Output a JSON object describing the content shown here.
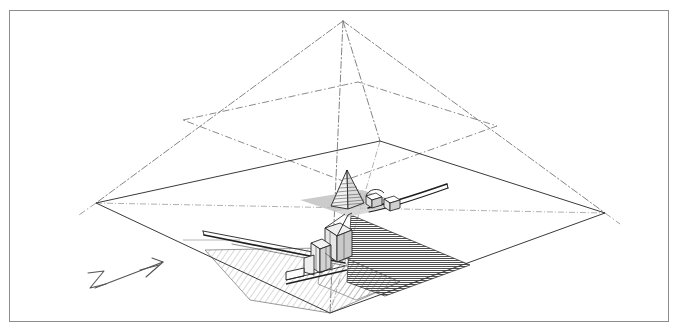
{
  "figure": {
    "kind": "axonometric-reconstruction-drawing",
    "subject": "Pyramid complex axonometric reconstruction",
    "caption": "",
    "background_color": "#ffffff",
    "frame": {
      "visible": true,
      "stroke_color": "#8c8c8c",
      "stroke_width": 1,
      "x": 9,
      "y": 10,
      "width": 659,
      "height": 311
    }
  },
  "palette": {
    "line_dark": "#2b2b2b",
    "line_mid": "#555555",
    "line_light": "#9a9a9a",
    "construction_line": "#767676",
    "hatch_light": "#8e8e8e",
    "hatch_dark": "#4f4f4f",
    "fill_dark_shade": "#6e6e6e",
    "shadow_gray": "#b9b9b9",
    "paper": "#ffffff"
  },
  "geometry": {
    "base_platform": {
      "name": "ground-base-quadrilateral",
      "description": "Large flat rhombus representing the pyramid base / ground plane in axonometric projection",
      "vertices": [
        {
          "label": "west",
          "x": 96,
          "y": 203
        },
        {
          "label": "north",
          "x": 380,
          "y": 141
        },
        {
          "label": "east",
          "x": 605,
          "y": 213
        },
        {
          "label": "south",
          "x": 330,
          "y": 313
        }
      ],
      "stroke_color": "#3a3a3a",
      "stroke_width": 1
    },
    "pyramid_reconstruction": {
      "name": "pyramid-edge-reconstruction",
      "description": "Dash-dot construction lines rising from the four base corners to a common apex, reconstructing the original pyramid volume",
      "apex": {
        "x": 343,
        "y": 21
      },
      "line_style": "dash-dot",
      "stroke_color": "#767676",
      "stroke_width": 0.9
    },
    "mid_course_quadrilateral": {
      "name": "intermediate-course-outline",
      "description": "Dash-dot quadrilateral marking a preserved intermediate course level of the pyramid",
      "vertices": [
        {
          "x": 183,
          "y": 120
        },
        {
          "x": 358,
          "y": 82
        },
        {
          "x": 497,
          "y": 126
        },
        {
          "x": 343,
          "y": 181
        }
      ],
      "line_style": "dash-dot",
      "stroke_color": "#767676"
    },
    "hatched_regions": [
      {
        "name": "light-hatched-apron-west",
        "description": "Light diagonal hatching marking the excavated / preserved pavement to the south-west of the core",
        "vertices": [
          {
            "x": 205,
            "y": 250
          },
          {
            "x": 323,
            "y": 248
          },
          {
            "x": 400,
            "y": 282
          },
          {
            "x": 330,
            "y": 313
          },
          {
            "x": 250,
            "y": 300
          }
        ],
        "hatch": "diagonal-light",
        "hatch_color": "#8e8e8e",
        "spacing": 3
      },
      {
        "name": "dark-shaded-face-east",
        "description": "Dense horizontal hatching forming the dark shaded triangular face east of the chapel group",
        "vertices": [
          {
            "x": 351,
            "y": 215
          },
          {
            "x": 470,
            "y": 265
          },
          {
            "x": 385,
            "y": 296
          },
          {
            "x": 347,
            "y": 282
          }
        ],
        "hatch": "horizontal-dense",
        "hatch_color": "#4f4f4f",
        "spacing": 2
      }
    ],
    "structures": [
      {
        "name": "satellite-pyramidion",
        "description": "Small stepped pyramid (pyramidion) standing on the base platform, drawn with horizontal course lines",
        "apex": {
          "x": 347,
          "y": 170
        },
        "base_left": {
          "x": 331,
          "y": 206
        },
        "base_right": {
          "x": 364,
          "y": 203
        },
        "course_count": 9,
        "stroke_color": "#2b2b2b"
      },
      {
        "name": "chapel-block-group",
        "description": "Cluster of small rectangular chapel / mastaba blocks south of the pyramidion",
        "stroke_color": "#2b2b2b"
      },
      {
        "name": "offering-structures",
        "description": "Small framed structures with open bays east of the pyramidion",
        "stroke_color": "#2b2b2b"
      }
    ],
    "linear_elements": [
      {
        "name": "causeway-rod-west",
        "description": "Long slender causeway / wall drawn as a thin double line running from the west toward the chapel group",
        "from": {
          "x": 205,
          "y": 232
        },
        "to": {
          "x": 345,
          "y": 262
        },
        "stroke_color": "#2b2b2b"
      },
      {
        "name": "causeway-rod-east",
        "description": "Curved slender wall element extending east from the chapel group",
        "from": {
          "x": 372,
          "y": 207
        },
        "to": {
          "x": 447,
          "y": 186
        },
        "stroke_color": "#2b2b2b"
      },
      {
        "name": "guide-line-horizontal",
        "description": "Faint light-gray horizontal guide line at mid-left",
        "from": {
          "x": 183,
          "y": 240
        },
        "to": {
          "x": 240,
          "y": 240
        },
        "stroke_color": "#b5b5b5"
      },
      {
        "name": "shadow-band",
        "description": "Soft gray cast-shadow band beneath the pyramidion",
        "stroke_color": "#b9b9b9"
      }
    ],
    "north_arrow": {
      "name": "north-arrow",
      "description": "Hand-drawn north indicator: a freehand letter N with a long arrow pointing up to the right",
      "letter": "N",
      "tail": {
        "x": 88,
        "y": 290
      },
      "head": {
        "x": 163,
        "y": 262
      },
      "stroke_color": "#555555"
    }
  },
  "annotations": {
    "labels": [],
    "scale_bar": null,
    "legend": null
  }
}
